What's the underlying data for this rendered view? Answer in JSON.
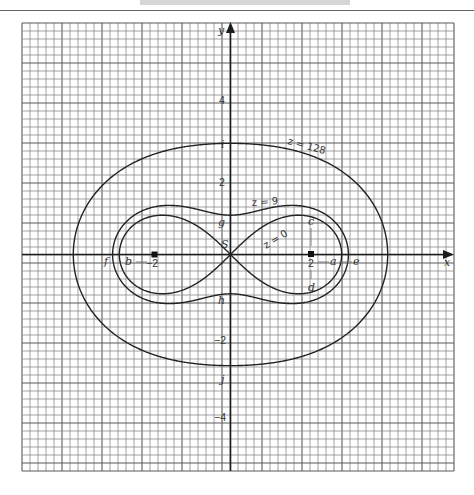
{
  "header": {
    "rule_color": "#666666"
  },
  "chart_data": {
    "type": "line",
    "subtype": "contour",
    "title": "",
    "xlabel": "x",
    "ylabel": "y",
    "grid": true,
    "grid_cell_units": 0.2,
    "xlim": [
      -5.3,
      5.6
    ],
    "ylim": [
      -5.5,
      5.9
    ],
    "x_tick_labels": [
      {
        "value": -2,
        "label": "−2"
      },
      {
        "value": 2,
        "label": "2"
      }
    ],
    "y_tick_labels": [
      {
        "value": 4,
        "label": "4"
      },
      {
        "value": 2,
        "label": "2"
      },
      {
        "value": -2,
        "label": "−2"
      },
      {
        "value": -4,
        "label": "−4"
      }
    ],
    "foci": [
      [
        -2,
        0
      ],
      [
        2,
        0
      ]
    ],
    "series": [
      {
        "name": "z = 0",
        "level": 0,
        "product": 4,
        "shape": "figure-eight",
        "x_intercepts": [
          -2.83,
          0,
          2.83
        ],
        "y_intercepts": [
          0
        ],
        "max_y": 1.0
      },
      {
        "name": "z = 9",
        "level": 9,
        "product": 5,
        "shape": "oval",
        "x_intercepts": [
          -3,
          3
        ],
        "y_intercepts": [
          -1,
          1
        ]
      },
      {
        "name": "z = 128",
        "level": 128,
        "product": 12,
        "shape": "oval",
        "x_intercepts": [
          -4,
          4
        ],
        "y_intercepts": [
          -2.83,
          2.83
        ]
      }
    ],
    "point_labels": [
      {
        "label": "S",
        "x": 0,
        "y": 0
      },
      {
        "label": "a",
        "x": 2.6,
        "y": 0
      },
      {
        "label": "b",
        "x": -2.6,
        "y": 0
      },
      {
        "label": "c",
        "x": 2,
        "y": 0.85
      },
      {
        "label": "d",
        "x": 2,
        "y": -0.85
      },
      {
        "label": "e",
        "x": 3.2,
        "y": 0
      },
      {
        "label": "f",
        "x": -3.2,
        "y": 0
      },
      {
        "label": "g",
        "x": 0,
        "y": 0.85
      },
      {
        "label": "h",
        "x": 0,
        "y": -1.15
      },
      {
        "label": "i",
        "x": 0,
        "y": 2.8
      },
      {
        "label": "j",
        "x": 0,
        "y": -3.2
      }
    ],
    "curve_labels": [
      {
        "label": "z = 128"
      },
      {
        "label": "z = 9"
      },
      {
        "label": "z = 0"
      }
    ],
    "colors": {
      "curve": "#222222",
      "grid": "#8c8c8c",
      "axis": "#1c1c1c"
    }
  }
}
